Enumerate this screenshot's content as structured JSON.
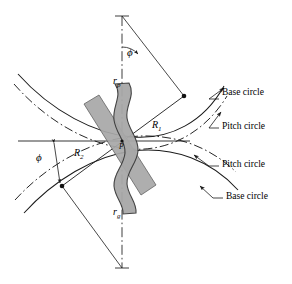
{
  "figure": {
    "background_color": "#ffffff",
    "line_color": "#1a1a1a",
    "tooth_fill_color": "#a8a8a8",
    "tooth_stroke_color": "#4d4d4d",
    "pitch_line_color": "#999999"
  },
  "callouts": [
    {
      "id": "base-circle-upper",
      "text": "Base circle"
    },
    {
      "id": "pitch-circle-upper",
      "text": "Pitch circle"
    },
    {
      "id": "pitch-circle-lower",
      "text": "Pitch circle"
    },
    {
      "id": "base-circle-lower",
      "text": "Base circle"
    }
  ],
  "symbols": {
    "pressure_angle_top": "ϕ",
    "pressure_angle_lower_left": "ϕ",
    "pinion_radius": "r",
    "pinion_radius_sub": "p",
    "gear_radius": "r",
    "gear_radius_sub": "g",
    "radius_upper": "R",
    "radius_upper_sub": "1",
    "radius_lower": "R",
    "radius_lower_sub": "2",
    "pitch_point": "P"
  }
}
